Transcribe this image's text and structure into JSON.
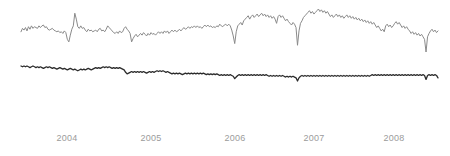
{
  "chart_data": {
    "type": "line",
    "title": "",
    "subtitle": "",
    "xlabel": "",
    "ylabel": "",
    "grid": false,
    "legend": "none",
    "axis": {
      "x_ticks": [
        "2004",
        "2005",
        "2006",
        "2007",
        "2008"
      ],
      "x_tick_positions_px": [
        67,
        151,
        235,
        314,
        394
      ],
      "xlim": [
        "2003-09",
        "2008-10"
      ],
      "ylim_upper": [
        0,
        1
      ],
      "ylim_lower": [
        0,
        1
      ]
    },
    "colors": {
      "background": "#ffffff",
      "upper_series_line": "#8a8a8a",
      "lower_series_line": "#2b2b2b",
      "tick_label": "#9b9b9b"
    },
    "series": [
      {
        "name": "upper-series",
        "color": "#8a8a8a",
        "line_width": 1,
        "values": [
          31,
          27,
          29,
          26,
          30,
          25,
          28,
          24,
          27,
          25,
          26,
          27,
          24,
          26,
          24,
          23,
          26,
          25,
          28,
          29,
          28,
          27,
          29,
          30,
          31,
          30,
          32,
          31,
          33,
          30,
          32,
          40,
          43,
          35,
          28,
          24,
          9,
          16,
          25,
          27,
          24,
          27,
          26,
          29,
          31,
          28,
          30,
          29,
          31,
          30,
          29,
          31,
          28,
          27,
          30,
          29,
          31,
          28,
          24,
          26,
          28,
          30,
          32,
          33,
          31,
          33,
          30,
          32,
          31,
          27,
          25,
          28,
          30,
          33,
          43,
          39,
          36,
          34,
          37,
          35,
          33,
          35,
          32,
          34,
          36,
          33,
          35,
          32,
          34,
          33,
          35,
          33,
          31,
          33,
          31,
          33,
          30,
          32,
          30,
          33,
          31,
          29,
          31,
          29,
          31,
          30,
          28,
          30,
          28,
          26,
          28,
          27,
          25,
          27,
          25,
          26,
          24,
          26,
          24,
          26,
          25,
          27,
          25,
          23,
          25,
          23,
          25,
          24,
          26,
          25,
          26,
          24,
          25,
          22,
          24,
          25,
          23,
          22,
          24,
          22,
          24,
          29,
          36,
          45,
          31,
          24,
          22,
          20,
          23,
          18,
          16,
          14,
          12,
          16,
          13,
          11,
          14,
          12,
          10,
          13,
          11,
          9,
          12,
          10,
          13,
          11,
          14,
          12,
          15,
          13,
          16,
          21,
          13,
          11,
          14,
          12,
          15,
          18,
          16,
          19,
          21,
          23,
          20,
          22,
          26,
          47,
          30,
          21,
          18,
          14,
          12,
          10,
          8,
          6,
          9,
          7,
          10,
          8,
          6,
          4,
          7,
          5,
          8,
          6,
          9,
          7,
          10,
          13,
          11,
          14,
          12,
          10,
          13,
          11,
          14,
          12,
          15,
          13,
          11,
          14,
          12,
          15,
          13,
          16,
          14,
          17,
          15,
          18,
          16,
          19,
          17,
          20,
          18,
          21,
          19,
          22,
          20,
          23,
          26,
          24,
          27,
          30,
          28,
          31,
          24,
          22,
          25,
          23,
          26,
          24,
          21,
          19,
          22,
          20,
          23,
          26,
          24,
          27,
          25,
          28,
          30,
          33,
          31,
          34,
          32,
          35,
          33,
          36,
          34,
          37,
          40,
          55,
          37,
          33,
          30,
          28,
          31,
          29,
          32,
          30
        ]
      },
      {
        "name": "lower-series",
        "color": "#2b2b2b",
        "line_width": 1.3,
        "values": [
          69,
          70,
          69,
          70,
          69,
          70,
          71,
          70,
          69,
          70,
          71,
          70,
          71,
          70,
          71,
          72,
          71,
          70,
          71,
          70,
          71,
          72,
          71,
          72,
          73,
          72,
          71,
          72,
          73,
          72,
          73,
          74,
          73,
          72,
          73,
          74,
          73,
          74,
          75,
          74,
          73,
          74,
          73,
          74,
          73,
          72,
          73,
          74,
          73,
          72,
          71,
          72,
          71,
          72,
          71,
          70,
          71,
          70,
          71,
          70,
          71,
          72,
          71,
          72,
          71,
          72,
          71,
          72,
          73,
          74,
          77,
          79,
          78,
          77,
          76,
          77,
          76,
          77,
          76,
          77,
          76,
          77,
          76,
          77,
          78,
          77,
          76,
          77,
          76,
          77,
          76,
          75,
          76,
          75,
          76,
          75,
          76,
          77,
          76,
          77,
          78,
          79,
          78,
          79,
          78,
          79,
          78,
          79,
          80,
          79,
          78,
          79,
          78,
          79,
          78,
          79,
          78,
          79,
          78,
          79,
          78,
          79,
          78,
          79,
          80,
          79,
          80,
          79,
          80,
          79,
          80,
          79,
          80,
          81,
          80,
          81,
          80,
          81,
          80,
          81,
          80,
          81,
          82,
          85,
          83,
          81,
          80,
          81,
          80,
          81,
          80,
          81,
          80,
          81,
          80,
          81,
          80,
          81,
          80,
          81,
          80,
          81,
          80,
          81,
          80,
          81,
          82,
          81,
          82,
          81,
          82,
          81,
          82,
          81,
          82,
          81,
          82,
          83,
          82,
          83,
          82,
          83,
          82,
          83,
          84,
          88,
          84,
          82,
          81,
          82,
          81,
          82,
          81,
          82,
          81,
          82,
          81,
          82,
          81,
          82,
          81,
          82,
          81,
          82,
          81,
          82,
          81,
          82,
          81,
          82,
          81,
          82,
          81,
          82,
          81,
          82,
          81,
          82,
          81,
          82,
          81,
          82,
          81,
          82,
          81,
          82,
          81,
          82,
          81,
          82,
          81,
          82,
          81,
          82,
          81,
          80,
          81,
          80,
          81,
          80,
          81,
          80,
          81,
          80,
          81,
          80,
          81,
          80,
          81,
          80,
          81,
          80,
          81,
          80,
          81,
          80,
          81,
          80,
          81,
          80,
          81,
          80,
          81,
          80,
          81,
          80,
          81,
          80,
          81,
          80,
          81,
          86,
          81,
          80,
          81,
          80,
          81,
          80,
          81,
          84
        ]
      }
    ]
  },
  "axis_labels": [
    {
      "text": "2004",
      "x": 67
    },
    {
      "text": "2005",
      "x": 151
    },
    {
      "text": "2006",
      "x": 235
    },
    {
      "text": "2007",
      "x": 314
    },
    {
      "text": "2008",
      "x": 394
    }
  ]
}
